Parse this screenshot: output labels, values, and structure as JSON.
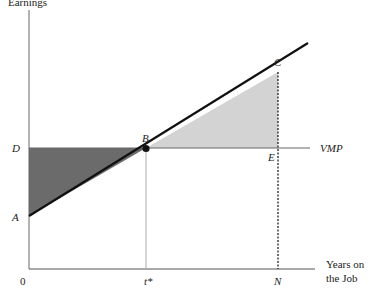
{
  "diagram": {
    "y_axis_label": "Earnings",
    "x_axis_label_line1": "Years on",
    "x_axis_label_line2": "the Job",
    "points": {
      "A": "A",
      "B": "B",
      "C": "C",
      "D": "D",
      "E": "E"
    },
    "curve_label": "VMP",
    "x_ticks": {
      "origin": "0",
      "t_star": "t*",
      "N": "N"
    },
    "colors": {
      "dark_area": "#6b6b6b",
      "light_area": "#d3d3d3",
      "line": "#111111",
      "axis": "#555555"
    }
  }
}
